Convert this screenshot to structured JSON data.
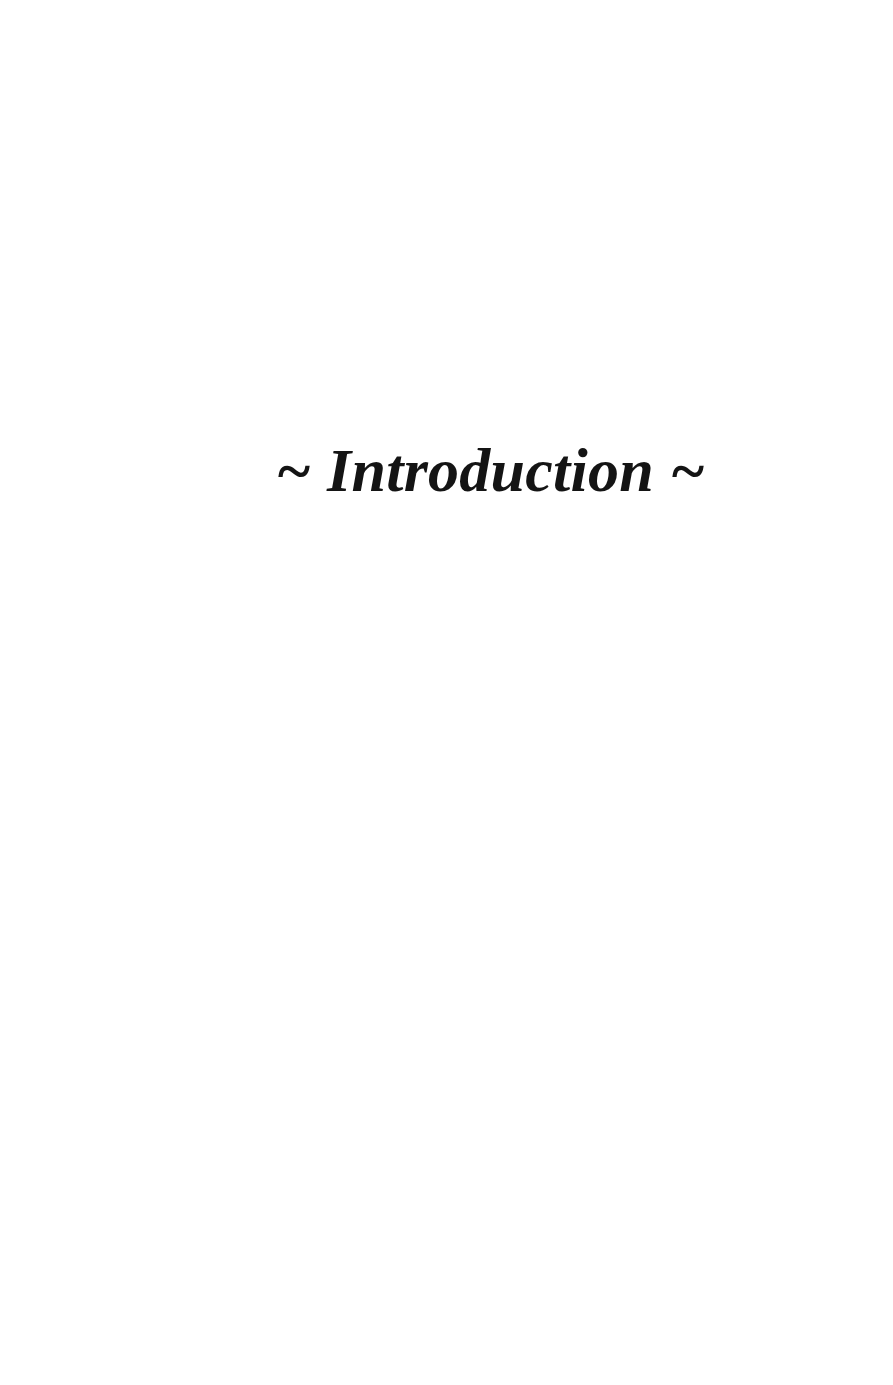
{
  "page": {
    "kind": "section-divider-page",
    "background_color": "#ffffff",
    "text_color": "#141414",
    "width": 893,
    "height": 1385
  },
  "section": {
    "ornament_left": "~",
    "title": "Introduction",
    "ornament_right": "~",
    "heading_full": "~ Introduction ~"
  }
}
